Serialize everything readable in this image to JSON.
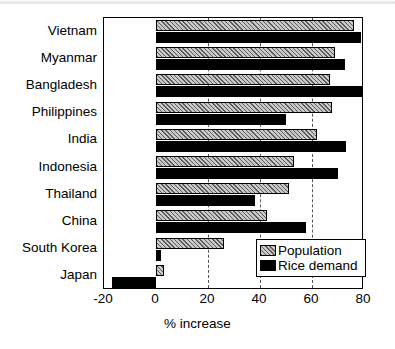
{
  "chart_data": {
    "type": "bar",
    "orientation": "horizontal",
    "title": "",
    "xlabel": "% increase",
    "ylabel": "",
    "xlim": [
      -20,
      80
    ],
    "xticks": [
      -20,
      0,
      20,
      40,
      60,
      80
    ],
    "xtick_labels": [
      "-20",
      "0",
      "20",
      "40",
      "60",
      "80"
    ],
    "gridlines": [
      20,
      40,
      60
    ],
    "grid": true,
    "grid_style": "dashed",
    "legend_position": "bottom-right",
    "categories": [
      "Vietnam",
      "Myanmar",
      "Bangladesh",
      "Philippines",
      "India",
      "Indonesia",
      "Thailand",
      "China",
      "South Korea",
      "Japan"
    ],
    "series": [
      {
        "name": "Population",
        "fill": "gray-hatched",
        "values": [
          76,
          69,
          67,
          67.5,
          62,
          53,
          51,
          42.5,
          26,
          3
        ]
      },
      {
        "name": "Rice demand",
        "fill": "black",
        "values": [
          79,
          72.5,
          79.5,
          50,
          73,
          70,
          38,
          57.5,
          2,
          -17
        ]
      }
    ]
  },
  "axis": {
    "x_title": "% increase"
  },
  "legend": {
    "entries": [
      {
        "label": "Population",
        "swatch": "gray-hatched-swatch"
      },
      {
        "label": "Rice demand",
        "swatch": "black-swatch"
      }
    ]
  }
}
